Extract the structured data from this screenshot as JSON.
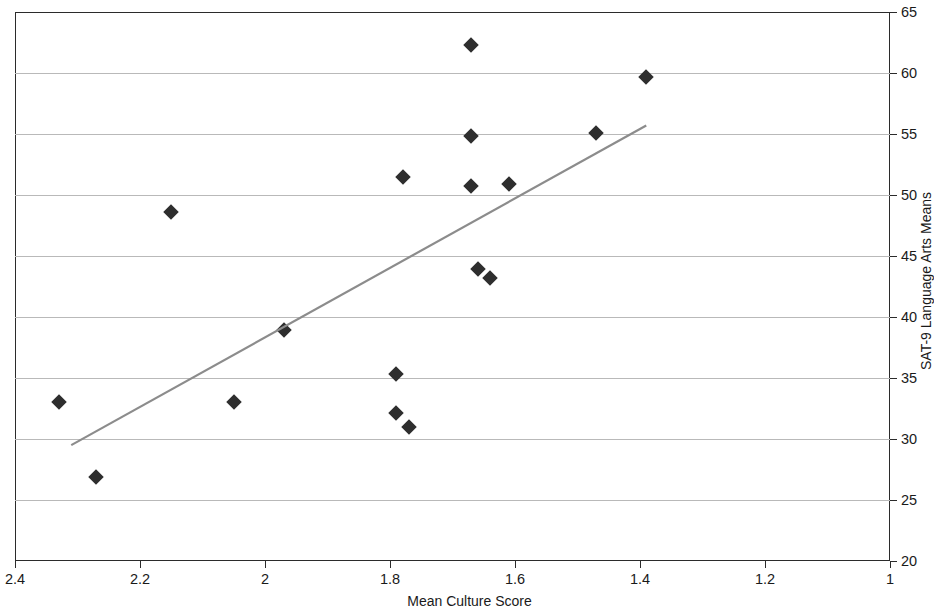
{
  "chart_data": {
    "type": "scatter",
    "title": "",
    "xlabel": "Mean Culture Score",
    "ylabel": "SAT-9 Language Arts Means",
    "xlim": [
      2.4,
      1.0
    ],
    "ylim": [
      20,
      65
    ],
    "x_reversed": true,
    "grid": "horizontal",
    "legend": "none",
    "xticks": [
      "2.4",
      "2.2",
      "2",
      "1.8",
      "1.6",
      "1.4",
      "1.2",
      "1"
    ],
    "xtick_values": [
      2.4,
      2.2,
      2.0,
      1.8,
      1.6,
      1.4,
      1.2,
      1.0
    ],
    "yticks": [
      "20",
      "25",
      "30",
      "35",
      "40",
      "45",
      "50",
      "55",
      "60",
      "65"
    ],
    "ytick_values": [
      20,
      25,
      30,
      35,
      40,
      45,
      50,
      55,
      60,
      65
    ],
    "marker_shape": "diamond",
    "marker_color": "#2e2e2e",
    "trendline_color": "#8c8c8c",
    "series": [
      {
        "name": "Schools",
        "points": [
          {
            "x": 2.33,
            "y": 33.0
          },
          {
            "x": 2.27,
            "y": 26.9
          },
          {
            "x": 2.15,
            "y": 48.6
          },
          {
            "x": 2.05,
            "y": 33.0
          },
          {
            "x": 1.97,
            "y": 38.9
          },
          {
            "x": 1.79,
            "y": 35.3
          },
          {
            "x": 1.79,
            "y": 32.1
          },
          {
            "x": 1.78,
            "y": 51.5
          },
          {
            "x": 1.77,
            "y": 31.0
          },
          {
            "x": 1.67,
            "y": 62.3
          },
          {
            "x": 1.67,
            "y": 54.8
          },
          {
            "x": 1.67,
            "y": 50.7
          },
          {
            "x": 1.66,
            "y": 43.9
          },
          {
            "x": 1.64,
            "y": 43.2
          },
          {
            "x": 1.61,
            "y": 50.9
          },
          {
            "x": 1.47,
            "y": 55.1
          },
          {
            "x": 1.39,
            "y": 59.7
          }
        ]
      }
    ],
    "trendline": {
      "x_start": 2.31,
      "y_start": 29.5,
      "x_end": 1.39,
      "y_end": 55.7
    }
  }
}
